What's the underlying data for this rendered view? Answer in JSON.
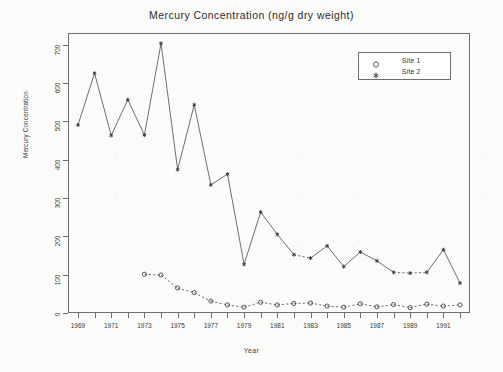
{
  "chart_data": {
    "type": "line",
    "title": "Mercury Concentration (ng/g dry weight)",
    "xlabel": "Year",
    "ylabel": "Mercury Concentration",
    "xlim": [
      1968.4,
      1992.6
    ],
    "ylim": [
      0,
      730
    ],
    "yticks": [
      0,
      100,
      200,
      300,
      400,
      500,
      600,
      700
    ],
    "ytick_labels": [
      "0",
      "100",
      "200",
      "300",
      "400",
      "500",
      "600",
      "700"
    ],
    "xticks": [
      1969,
      1970,
      1971,
      1972,
      1973,
      1974,
      1975,
      1976,
      1977,
      1978,
      1979,
      1980,
      1981,
      1982,
      1983,
      1984,
      1985,
      1986,
      1987,
      1988,
      1989,
      1990,
      1991,
      1992
    ],
    "xtick_labels": [
      "1969",
      "1971",
      "1973",
      "1975",
      "1977",
      "1979",
      "1981",
      "1983",
      "1985",
      "1987",
      "1989",
      "1991"
    ],
    "xtick_labeled_years": [
      1969,
      1971,
      1973,
      1975,
      1977,
      1979,
      1981,
      1983,
      1985,
      1987,
      1989,
      1991
    ],
    "grid": false,
    "legend_position": "top-right",
    "line_color": "#555555",
    "series": [
      {
        "name": "Site 1",
        "marker": "circle",
        "linestyle": "dashed",
        "x": [
          1973,
          1974,
          1975,
          1976,
          1977,
          1978,
          1979,
          1980,
          1981,
          1982,
          1983,
          1984,
          1985,
          1986,
          1987,
          1988,
          1989,
          1990,
          1991,
          1992
        ],
        "values": [
          101,
          99,
          65,
          53,
          31,
          21,
          15,
          28,
          21,
          25,
          26,
          18,
          15,
          24,
          16,
          22,
          14,
          23,
          18,
          21
        ]
      },
      {
        "name": "Site 2",
        "marker": "asterisk",
        "linestyle": "solid-dashed",
        "x": [
          1969,
          1970,
          1971,
          1972,
          1973,
          1974,
          1975,
          1976,
          1977,
          1978,
          1979,
          1980,
          1981,
          1982,
          1983,
          1984,
          1985,
          1986,
          1987,
          1988,
          1989,
          1990,
          1991,
          1992
        ],
        "values": [
          490,
          625,
          463,
          556,
          464,
          703,
          374,
          543,
          334,
          362,
          127,
          263,
          205,
          152,
          143,
          175,
          121,
          159,
          136,
          106,
          104,
          106,
          165,
          78
        ]
      }
    ]
  },
  "legend": {
    "entries": [
      {
        "label": "Site 1",
        "marker": "circle-marker"
      },
      {
        "label": "Site 2",
        "marker": "asterisk-marker"
      }
    ]
  }
}
